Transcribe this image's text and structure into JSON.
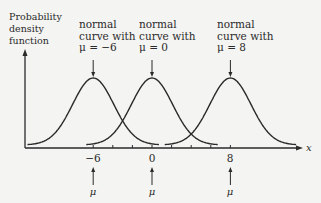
{
  "chart_data": {
    "type": "line",
    "title": "",
    "xlabel": "x",
    "ylabel": "Probability density function",
    "ylabel_lines": [
      "Probability",
      "density",
      "function"
    ],
    "xlim": [
      -13,
      15
    ],
    "x_ticks": [
      -6,
      -4,
      -2,
      0,
      2,
      4,
      6,
      8
    ],
    "x_tick_labels": [
      {
        "value": -6,
        "label": "−6"
      },
      {
        "value": 0,
        "label": "0"
      },
      {
        "value": 8,
        "label": "8"
      }
    ],
    "grid": false,
    "legend": "none (curves annotated with text labels and arrows)",
    "series": [
      {
        "name": "normal curve with μ = −6",
        "mean": -6,
        "std_dev": "equal across curves (~2)"
      },
      {
        "name": "normal curve with μ = 0",
        "mean": 0,
        "std_dev": "equal across curves (~2)"
      },
      {
        "name": "normal curve with μ = 8",
        "mean": 8,
        "std_dev": "equal across curves (~2)"
      }
    ],
    "annotations": [
      {
        "lines": [
          "normal",
          "curve with",
          "μ = −6"
        ],
        "points_to": "peak at x = −6"
      },
      {
        "lines": [
          "normal",
          "curve with",
          "μ = 0"
        ],
        "points_to": "peak at x = 0"
      },
      {
        "lines": [
          "normal",
          "curve with",
          "μ = 8"
        ],
        "points_to": "peak at x = 8"
      }
    ],
    "mean_markers": [
      {
        "x": -6,
        "label": "μ"
      },
      {
        "x": 0,
        "label": "μ"
      },
      {
        "x": 8,
        "label": "μ"
      }
    ]
  },
  "labels": {
    "ylabel": [
      "Probability",
      "density",
      "function"
    ],
    "ann1": [
      "normal",
      "curve with",
      "μ = −6"
    ],
    "ann2": [
      "normal",
      "curve with",
      "μ = 0"
    ],
    "ann3": [
      "normal",
      "curve with",
      "μ = 8"
    ],
    "tick1": "−6",
    "tick2": "0",
    "tick3": "8",
    "mu": "μ",
    "xname": "x"
  }
}
